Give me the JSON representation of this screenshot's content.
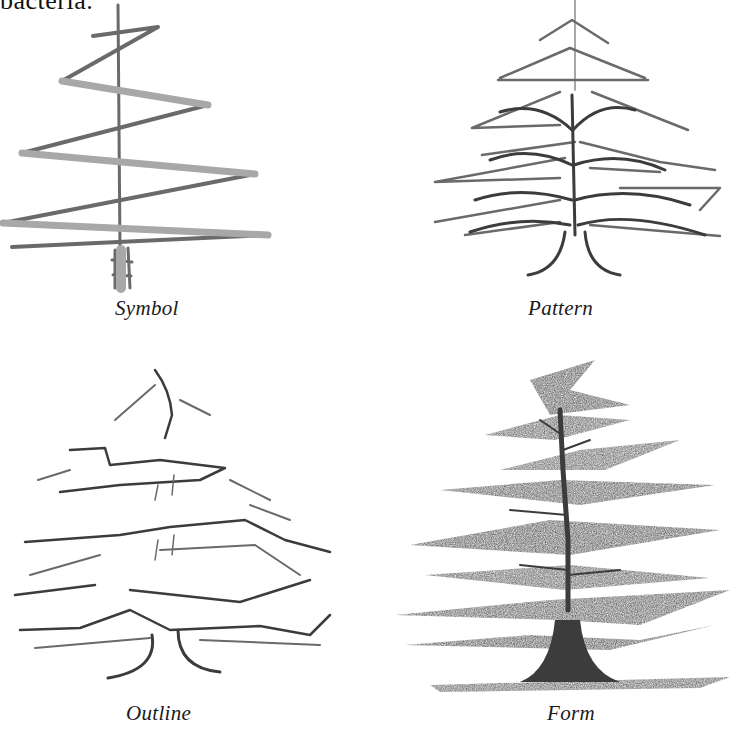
{
  "page": {
    "top_text_fragment": "bacteria."
  },
  "figure": {
    "panels": [
      {
        "id": "symbol",
        "caption": "Symbol",
        "drawing": "zigzag-tree-sketch-icon"
      },
      {
        "id": "pattern",
        "caption": "Pattern",
        "drawing": "branch-pattern-tree-sketch-icon"
      },
      {
        "id": "outline",
        "caption": "Outline",
        "drawing": "outline-tree-sketch-icon"
      },
      {
        "id": "form",
        "caption": "Form",
        "drawing": "shaded-form-tree-sketch-icon"
      }
    ]
  },
  "colors": {
    "paper": "#ffffff",
    "pencil_dark": "#3c3c3c",
    "pencil_mid": "#6a6a6a",
    "pencil_light": "#a8a8a8",
    "text": "#1a1a1a"
  }
}
